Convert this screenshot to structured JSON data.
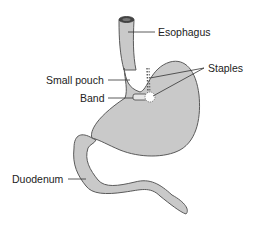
{
  "diagram": {
    "type": "anatomical illustration",
    "colors": {
      "organ_fill": "#c9c9c9",
      "organ_outline": "#5a5a5a",
      "leader_line": "#333333",
      "text": "#222222",
      "background": "#ffffff"
    },
    "labels": {
      "esophagus": "Esophagus",
      "staples": "Staples",
      "small_pouch": "Small pouch",
      "band": "Band",
      "duodenum": "Duodenum"
    }
  }
}
